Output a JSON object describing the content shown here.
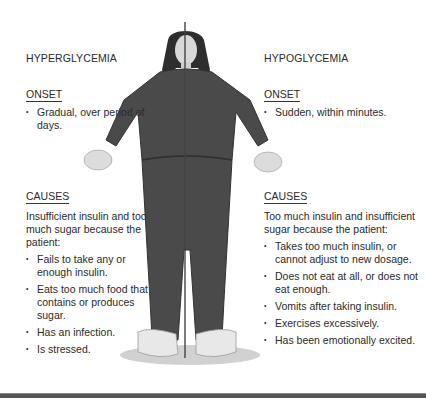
{
  "left": {
    "title": "HYPERGLYCEMIA",
    "onset": {
      "heading": "ONSET",
      "items": [
        "Gradual, over period of days."
      ]
    },
    "causes": {
      "heading": "CAUSES",
      "intro": "Insufficient insulin and too much sugar because the patient:",
      "items": [
        "Fails to take any or enough insulin.",
        "Eats too much food that contains or produces sugar.",
        "Has an infection.",
        "Is stressed."
      ]
    }
  },
  "right": {
    "title": "HYPOGLYCEMIA",
    "onset": {
      "heading": "ONSET",
      "items": [
        "Sudden, within minutes."
      ]
    },
    "causes": {
      "heading": "CAUSES",
      "intro": "Too much insulin and insufficient sugar because the patient:",
      "items": [
        "Takes too much insulin, or cannot adjust to new dosage.",
        "Does not eat at all, or does not eat enough.",
        "Vomits after taking insulin.",
        "Exercises excessively.",
        "Has been emotionally excited."
      ]
    }
  },
  "figure": {
    "divider": "vertical-center-line"
  },
  "colors": {
    "text": "#2a2a2a",
    "clothing": "#4a4a4a",
    "skin": "#d9d9d9",
    "shoes": "#e6e6e6",
    "rule": "#555555"
  }
}
